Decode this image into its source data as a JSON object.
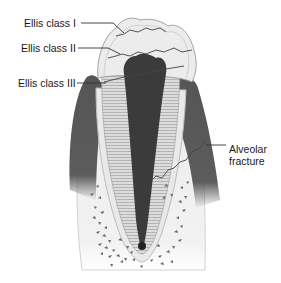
{
  "diagram": {
    "labels": [
      {
        "id": "ellis-class-1",
        "text": "Ellis class I"
      },
      {
        "id": "ellis-class-2",
        "text": "Ellis class II"
      },
      {
        "id": "ellis-class-3",
        "text": "Ellis class III"
      },
      {
        "id": "alveolar-fracture",
        "line1": "Alveolar",
        "line2": "fracture"
      }
    ],
    "colors": {
      "gum": "#5a5a5a",
      "pulp": "#3a3a3a",
      "dentin": "#cfcfcf",
      "enamel": "#e8e8e8",
      "bone": "#f0f0f0",
      "bone_spots": "#6a6a6a",
      "line": "#333333"
    }
  }
}
